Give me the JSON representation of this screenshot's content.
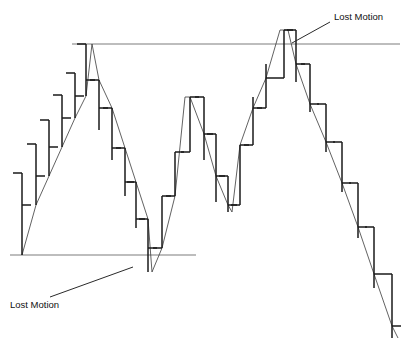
{
  "chart_data": {
    "type": "bar",
    "subtype": "ohlc-open-close-tick-bar",
    "title": "",
    "subtitle": "",
    "xlabel": "",
    "ylabel": "",
    "grid": false,
    "legend": false,
    "axes_visible": false,
    "xlim": [
      0,
      409
    ],
    "ylim": [
      345,
      0
    ],
    "y_direction": "price increases upward",
    "colors": {
      "bar": "#1a1a1a",
      "trend_line": "#3a3a3a",
      "level_line": "#7d7d7d",
      "annotation_text": "#111111",
      "background": "#ffffff"
    },
    "series_name": "price",
    "bar_width_ticks": 9,
    "categories": [
      "1",
      "2",
      "3",
      "4",
      "5",
      "6",
      "7",
      "8",
      "9",
      "10",
      "11",
      "12",
      "13",
      "14",
      "15",
      "16",
      "17",
      "18",
      "19",
      "20",
      "21",
      "22",
      "23",
      "24",
      "25",
      "26",
      "27",
      "28"
    ],
    "bars": [
      {
        "i": 1,
        "x": 22,
        "high": 173,
        "low": 255,
        "open": 173,
        "close": 205
      },
      {
        "i": 2,
        "x": 36,
        "high": 144,
        "low": 205,
        "open": 144,
        "close": 176
      },
      {
        "i": 3,
        "x": 49,
        "high": 120,
        "low": 176,
        "open": 120,
        "close": 147
      },
      {
        "i": 4,
        "x": 62,
        "high": 95,
        "low": 147,
        "open": 95,
        "close": 118
      },
      {
        "i": 5,
        "x": 75,
        "high": 73,
        "low": 118,
        "open": 73,
        "close": 96
      },
      {
        "i": 6,
        "x": 86,
        "high": 44,
        "low": 96,
        "open": 44,
        "close": 80
      },
      {
        "i": 7,
        "x": 99,
        "high": 80,
        "low": 130,
        "open": 80,
        "close": 108
      },
      {
        "i": 8,
        "x": 112,
        "high": 108,
        "low": 160,
        "open": 108,
        "close": 148
      },
      {
        "i": 9,
        "x": 125,
        "high": 148,
        "low": 196,
        "open": 148,
        "close": 182
      },
      {
        "i": 10,
        "x": 136,
        "high": 182,
        "low": 228,
        "open": 182,
        "close": 219
      },
      {
        "i": 11,
        "x": 148,
        "high": 219,
        "low": 272,
        "open": 219,
        "close": 248
      },
      {
        "i": 12,
        "x": 162,
        "high": 196,
        "low": 248,
        "open": 248,
        "close": 196
      },
      {
        "i": 13,
        "x": 175,
        "high": 152,
        "low": 196,
        "open": 196,
        "close": 152
      },
      {
        "i": 14,
        "x": 190,
        "high": 97,
        "low": 152,
        "open": 152,
        "close": 97
      },
      {
        "i": 15,
        "x": 204,
        "high": 97,
        "low": 160,
        "open": 97,
        "close": 134
      },
      {
        "i": 16,
        "x": 216,
        "high": 134,
        "low": 202,
        "open": 134,
        "close": 176
      },
      {
        "i": 17,
        "x": 228,
        "high": 176,
        "low": 212,
        "open": 176,
        "close": 205
      },
      {
        "i": 18,
        "x": 240,
        "high": 145,
        "low": 205,
        "open": 205,
        "close": 145
      },
      {
        "i": 19,
        "x": 253,
        "high": 97,
        "low": 145,
        "open": 145,
        "close": 108
      },
      {
        "i": 20,
        "x": 266,
        "high": 64,
        "low": 108,
        "open": 108,
        "close": 78
      },
      {
        "i": 21,
        "x": 284,
        "high": 30,
        "low": 78,
        "open": 78,
        "close": 30
      },
      {
        "i": 22,
        "x": 296,
        "high": 30,
        "low": 82,
        "open": 30,
        "close": 64
      },
      {
        "i": 23,
        "x": 310,
        "high": 64,
        "low": 112,
        "open": 64,
        "close": 104
      },
      {
        "i": 24,
        "x": 326,
        "high": 104,
        "low": 152,
        "open": 104,
        "close": 142
      },
      {
        "i": 25,
        "x": 342,
        "high": 142,
        "low": 192,
        "open": 142,
        "close": 183
      },
      {
        "i": 26,
        "x": 358,
        "high": 183,
        "low": 238,
        "open": 183,
        "close": 227
      },
      {
        "i": 27,
        "x": 374,
        "high": 227,
        "low": 288,
        "open": 227,
        "close": 274
      },
      {
        "i": 28,
        "x": 392,
        "high": 274,
        "low": 338,
        "open": 274,
        "close": 326
      }
    ],
    "trend_path_points": [
      [
        22,
        255
      ],
      [
        36,
        205
      ],
      [
        49,
        176
      ],
      [
        62,
        147
      ],
      [
        75,
        118
      ],
      [
        86,
        96
      ],
      [
        92,
        44
      ],
      [
        99,
        80
      ],
      [
        112,
        108
      ],
      [
        125,
        148
      ],
      [
        136,
        182
      ],
      [
        148,
        219
      ],
      [
        152,
        272
      ],
      [
        162,
        248
      ],
      [
        175,
        196
      ],
      [
        185,
        97
      ],
      [
        190,
        97
      ],
      [
        204,
        134
      ],
      [
        216,
        176
      ],
      [
        228,
        205
      ],
      [
        232,
        212
      ],
      [
        240,
        145
      ],
      [
        253,
        108
      ],
      [
        266,
        78
      ],
      [
        280,
        30
      ],
      [
        288,
        30
      ],
      [
        296,
        64
      ],
      [
        310,
        104
      ],
      [
        326,
        142
      ],
      [
        342,
        183
      ],
      [
        358,
        227
      ],
      [
        374,
        274
      ],
      [
        392,
        326
      ],
      [
        398,
        338
      ]
    ],
    "level_lines": [
      {
        "name": "resistance-line",
        "y": 44,
        "x1": 72,
        "x2": 400,
        "label": "upper horizontal level"
      },
      {
        "name": "support-line",
        "y": 255,
        "x1": 10,
        "x2": 196,
        "label": "lower horizontal level"
      }
    ],
    "annotations": [
      {
        "id": "lost-motion-top",
        "text": "Lost Motion",
        "text_x": 334,
        "text_y": 20,
        "anchor": "start",
        "leader": [
          [
            330,
            22
          ],
          [
            292,
            43
          ]
        ],
        "points_to": "top peak overshoot above resistance line"
      },
      {
        "id": "lost-motion-bottom",
        "text": "Lost Motion",
        "text_x": 10,
        "text_y": 308,
        "anchor": "start",
        "leader": [
          [
            50,
            297
          ],
          [
            133,
            267
          ]
        ],
        "points_to": "bottom trough undershoot below support line"
      }
    ]
  }
}
